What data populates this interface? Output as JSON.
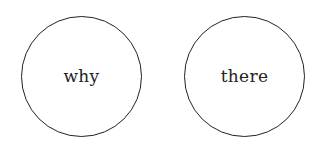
{
  "diagram": {
    "nodes": [
      {
        "label": "why",
        "shape": "circle"
      },
      {
        "label": "there",
        "shape": "circle"
      }
    ],
    "colors": {
      "stroke": "#222222",
      "text": "#222222",
      "background": "#ffffff"
    }
  }
}
